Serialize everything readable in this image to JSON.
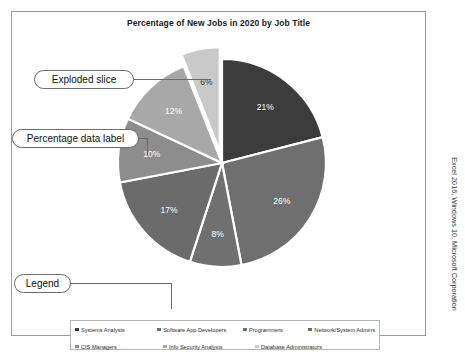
{
  "chart_data": {
    "type": "pie",
    "title": "Percentage of New Jobs in 2020 by Job Title",
    "categories": [
      "Systems Analysts",
      "Software App Developers",
      "Programmers",
      "Network/System Admins",
      "CIS Managers",
      "Info Security Analysts",
      "Database Administrators"
    ],
    "values": [
      21,
      26,
      8,
      17,
      10,
      12,
      6
    ],
    "labels": [
      "21%",
      "26%",
      "8%",
      "17%",
      "10%",
      "12%",
      "6%"
    ],
    "colors": [
      "#3c3c3c",
      "#6f6f6f",
      "#707070",
      "#6b6b6b",
      "#8d8d8d",
      "#a8a8a8",
      "#c9c9c9"
    ],
    "exploded_slice": "Database Administrators",
    "legend_position": "bottom",
    "data_labels": "percentage",
    "xlabel": "",
    "ylabel": ""
  },
  "callouts": {
    "exploded": "Exploded slice",
    "data_label": "Percentage data label",
    "legend": "Legend"
  },
  "credit": "Excel 2016, Windows 10, Microsoft Corporation"
}
